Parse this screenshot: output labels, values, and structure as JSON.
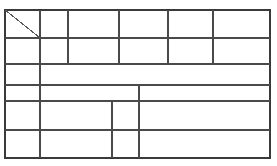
{
  "document": {
    "kind": "scanned-blank-table",
    "title": "",
    "background_color": "#ffffff",
    "canvas": {
      "width": 277,
      "height": 166
    }
  },
  "table": {
    "name": "blank-ruled-table",
    "has_text": false,
    "border": {
      "color": "#3a3a3a",
      "outer_width": 2.2,
      "inner_width": 1.3,
      "x0": 5,
      "y0": 10,
      "x1": 270,
      "y1": 158
    },
    "row_lines": [
      {
        "id": "row-line-1",
        "y": 38,
        "x_start": 5,
        "x_end": 270,
        "weight": 1.3
      },
      {
        "id": "row-line-2",
        "y": 64,
        "x_start": 5,
        "x_end": 270,
        "weight": 1.3
      },
      {
        "id": "row-line-3",
        "y": 85,
        "x_start": 5,
        "x_end": 270,
        "weight": 1.3
      },
      {
        "id": "row-line-4",
        "y": 101,
        "x_start": 5,
        "x_end": 270,
        "weight": 1.3
      },
      {
        "id": "row-line-5",
        "y": 130,
        "x_start": 5,
        "x_end": 270,
        "weight": 1.3
      }
    ],
    "column_lines": [
      {
        "id": "col-line-a",
        "x": 40,
        "y_start": 10,
        "y_end": 158,
        "weight": 1.3
      },
      {
        "id": "col-line-b",
        "x": 68,
        "y_start": 10,
        "y_end": 64,
        "weight": 1.3
      },
      {
        "id": "col-line-c",
        "x": 119,
        "y_start": 10,
        "y_end": 64,
        "weight": 1.3
      },
      {
        "id": "col-line-d",
        "x": 168,
        "y_start": 10,
        "y_end": 64,
        "weight": 1.3
      },
      {
        "id": "col-line-e",
        "x": 213,
        "y_start": 10,
        "y_end": 64,
        "weight": 1.3
      },
      {
        "id": "col-line-f",
        "x": 139,
        "y_start": 85,
        "y_end": 158,
        "weight": 1.3
      },
      {
        "id": "col-line-g",
        "x": 112,
        "y_start": 101,
        "y_end": 158,
        "weight": 1.3
      }
    ],
    "diagonal": {
      "id": "header-corner-diagonal",
      "x1": 5,
      "y1": 10,
      "x2": 40,
      "y2": 38,
      "color": "#5a5a5a",
      "weight": 1.1
    },
    "rows": [
      {
        "index": 1,
        "y_top": 10,
        "y_bottom": 38,
        "cells": [
          "",
          "",
          "",
          "",
          "",
          ""
        ]
      },
      {
        "index": 2,
        "y_top": 38,
        "y_bottom": 64,
        "cells": [
          "",
          "",
          "",
          "",
          "",
          ""
        ]
      },
      {
        "index": 3,
        "y_top": 64,
        "y_bottom": 85,
        "cells": [
          "",
          ""
        ]
      },
      {
        "index": 4,
        "y_top": 85,
        "y_bottom": 101,
        "cells": [
          "",
          "",
          ""
        ]
      },
      {
        "index": 5,
        "y_top": 101,
        "y_bottom": 130,
        "cells": [
          "",
          "",
          "",
          ""
        ]
      },
      {
        "index": 6,
        "y_top": 130,
        "y_bottom": 158,
        "cells": [
          "",
          "",
          "",
          ""
        ]
      }
    ]
  }
}
